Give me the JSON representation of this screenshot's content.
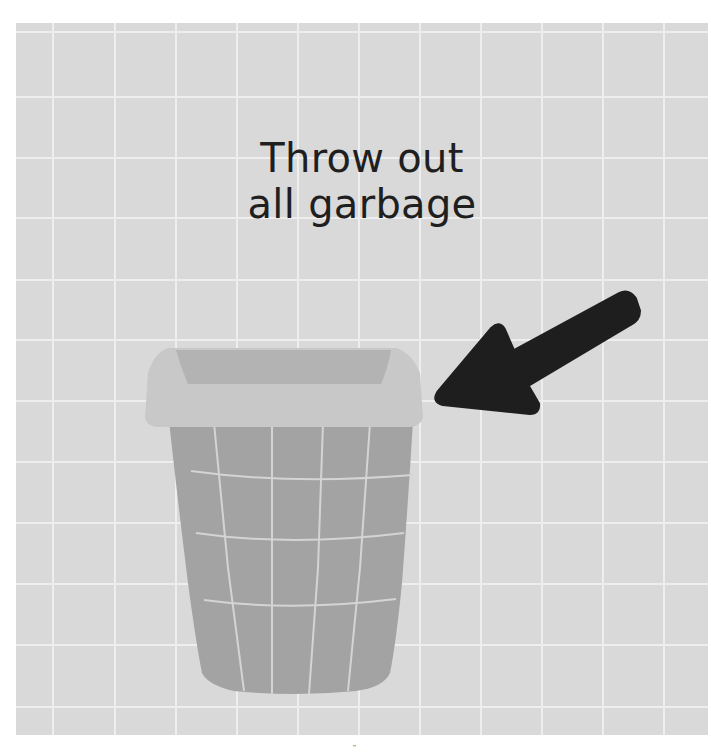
{
  "illustration": {
    "caption_lines": [
      "Throw out",
      "all garbage"
    ],
    "background_color": "#d9d9d9",
    "grid_line_color": "#eeeeee",
    "grid": {
      "vertical_lines_x": [
        37,
        99,
        160,
        221,
        282,
        343,
        404,
        465,
        526,
        587,
        648
      ],
      "horizontal_lines_y": [
        9,
        74,
        135,
        195,
        257,
        317,
        378,
        439,
        500,
        561,
        622,
        684
      ]
    },
    "trash_can": {
      "label": "trash-can",
      "lid_color": "#c8c8c8",
      "lid_inner_color": "#b3b3b3",
      "body_color": "#a3a3a3",
      "mesh_color": "#d4d4d4"
    },
    "arrow": {
      "label": "arrow-pointing-to-trash-can",
      "color": "#1e1e1e"
    }
  },
  "footer": {
    "mark": "\""
  }
}
